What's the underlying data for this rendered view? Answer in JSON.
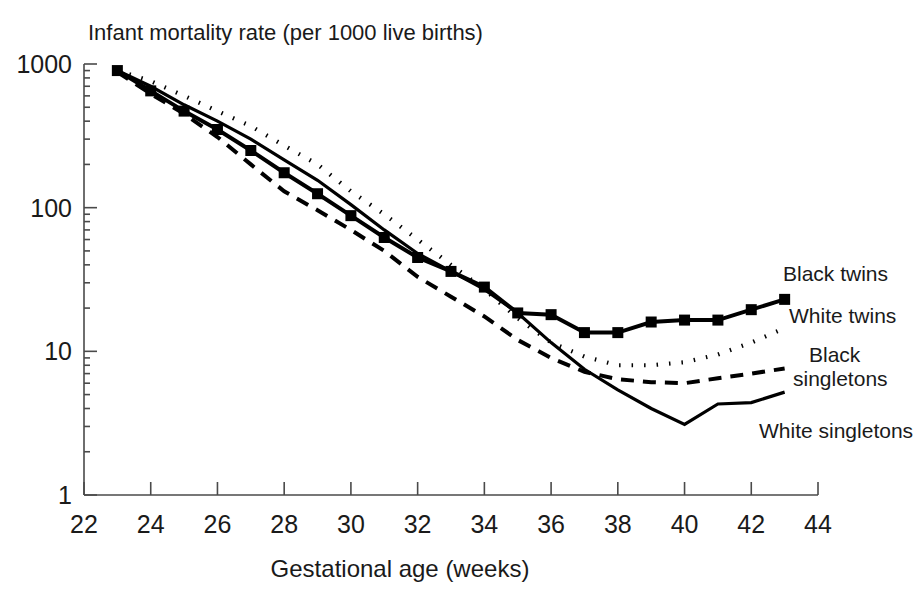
{
  "chart_data": {
    "type": "line",
    "title": "Infant mortality rate (per 1000 live births)",
    "xlabel": "Gestational age (weeks)",
    "ylabel": "Infant mortality rate (per 1000 live births)",
    "yscale": "log",
    "ylim": [
      1,
      1000
    ],
    "xlim": [
      22,
      44
    ],
    "xticks": [
      22,
      24,
      26,
      28,
      30,
      32,
      34,
      36,
      38,
      40,
      42,
      44
    ],
    "xtick_labels": [
      "22",
      "24",
      "26",
      "28",
      "30",
      "32",
      "34",
      "36",
      "38",
      "40",
      "42",
      "44"
    ],
    "yticks": [
      1,
      10,
      100,
      1000
    ],
    "ytick_labels": [
      "1",
      "10",
      "100",
      "1000"
    ],
    "y_minor_ticks": [
      2,
      3,
      4,
      5,
      6,
      7,
      8,
      9,
      20,
      30,
      40,
      50,
      60,
      70,
      80,
      90,
      200,
      300,
      400,
      500,
      600,
      700,
      800,
      900
    ],
    "grid": false,
    "legend_position": "right-inline",
    "x": [
      23,
      24,
      25,
      26,
      27,
      28,
      29,
      30,
      31,
      32,
      33,
      34,
      35,
      36,
      37,
      38,
      39,
      40,
      41,
      42,
      43
    ],
    "series": [
      {
        "name": "Black twins",
        "label": "Black twins",
        "style": "solid-with-square-markers",
        "color": "#000000",
        "markers": true,
        "values": [
          900,
          650,
          470,
          350,
          250,
          175,
          125,
          88,
          62,
          45,
          36,
          28,
          18.5,
          18,
          13.5,
          13.5,
          16,
          16.5,
          16.5,
          19.5,
          23
        ]
      },
      {
        "name": "White twins",
        "label": "White twins",
        "style": "dotted",
        "color": "#000000",
        "markers": false,
        "values": [
          900,
          760,
          600,
          470,
          370,
          270,
          200,
          130,
          90,
          60,
          40,
          27,
          17,
          11.5,
          9.2,
          8.0,
          8.0,
          8.4,
          9.5,
          11.5,
          14.5
        ]
      },
      {
        "name": "Black singletons",
        "label": "Black singletons",
        "style": "dashed",
        "color": "#000000",
        "markers": false,
        "values": [
          880,
          620,
          450,
          310,
          200,
          130,
          96,
          70,
          50,
          33,
          24,
          17.5,
          12,
          9.0,
          7.2,
          6.4,
          6.1,
          6.0,
          6.5,
          7.0,
          7.6
        ]
      },
      {
        "name": "White singletons",
        "label": "White singletons",
        "style": "solid",
        "color": "#000000",
        "markers": false,
        "values": [
          900,
          700,
          520,
          400,
          300,
          215,
          155,
          105,
          70,
          48,
          36,
          27,
          18.5,
          11.5,
          7.5,
          5.4,
          4.0,
          3.1,
          4.3,
          4.4,
          5.2
        ]
      }
    ],
    "annotations": [
      {
        "text": "Black twins",
        "x": 783,
        "y": 281,
        "anchor": "start"
      },
      {
        "text": "White twins",
        "x": 789,
        "y": 323,
        "anchor": "start"
      },
      {
        "text": "Black",
        "x": 809,
        "y": 362,
        "anchor": "start"
      },
      {
        "text": "singletons",
        "x": 793,
        "y": 386,
        "anchor": "start"
      },
      {
        "text": "White singletons",
        "x": 759,
        "y": 438,
        "anchor": "start"
      }
    ]
  },
  "layout": {
    "plot_left": 84,
    "plot_right": 818,
    "plot_top": 64,
    "plot_bottom": 495,
    "title_x": 88,
    "title_y": 40,
    "xlabel_x": 400,
    "xlabel_y": 577
  }
}
